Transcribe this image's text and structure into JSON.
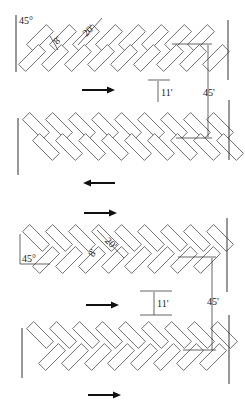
{
  "diagram": {
    "top_layout": {
      "angle_label": "45°",
      "stall_width_label": "8'",
      "stall_length_label": "20'",
      "aisle_label": "11'",
      "module_label": "45'",
      "row1_flow": "right",
      "row2_flow": "left"
    },
    "bottom_layout": {
      "angle_label": "45°",
      "stall_width_label": "8'",
      "stall_length_label": "20'",
      "aisle_label": "11'",
      "module_label": "45'",
      "row1_flow": "right",
      "row2_flow": "right",
      "row3_flow": "right"
    },
    "colors": {
      "line": "#555555",
      "text": "#222222",
      "background": "#ffffff"
    }
  }
}
